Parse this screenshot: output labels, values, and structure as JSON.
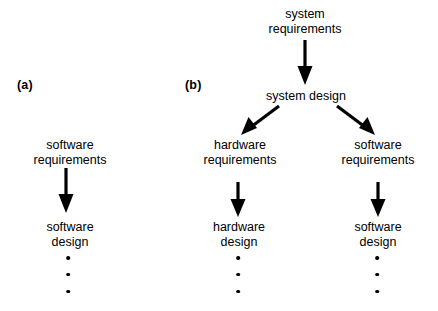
{
  "figure": {
    "background_color": "#ffffff",
    "ink_color": "#000000",
    "panels": [
      {
        "id": "a",
        "label": "(a)",
        "nodes": [
          {
            "id": "sw-req-a",
            "lines": [
              "software",
              "requirements"
            ]
          },
          {
            "id": "sw-design-a",
            "lines": [
              "software",
              "design"
            ]
          }
        ],
        "ellipsis_dots": 3
      },
      {
        "id": "b",
        "label": "(b)",
        "nodes": [
          {
            "id": "sys-req-b",
            "lines": [
              "system",
              "requirements"
            ]
          },
          {
            "id": "sys-design-b",
            "lines": [
              "system design"
            ]
          },
          {
            "id": "hw-req-b",
            "lines": [
              "hardware",
              "requirements"
            ]
          },
          {
            "id": "sw-req-b",
            "lines": [
              "software",
              "requirements"
            ]
          },
          {
            "id": "hw-design-b",
            "lines": [
              "hardware",
              "design"
            ]
          },
          {
            "id": "sw-design-b",
            "lines": [
              "software",
              "design"
            ]
          }
        ],
        "ellipsis_dots_left": 3,
        "ellipsis_dots_right": 3
      }
    ]
  },
  "panel_a": {
    "label": "(a)",
    "software_requirements_line1": "software",
    "software_requirements_line2": "requirements",
    "software_design_line1": "software",
    "software_design_line2": "design"
  },
  "panel_b": {
    "label": "(b)",
    "system_requirements_line1": "system",
    "system_requirements_line2": "requirements",
    "system_design_line1": "system design",
    "hardware_requirements_line1": "hardware",
    "hardware_requirements_line2": "requirements",
    "software_requirements_line1": "software",
    "software_requirements_line2": "requirements",
    "hardware_design_line1": "hardware",
    "hardware_design_line2": "design",
    "software_design_line1": "software",
    "software_design_line2": "design"
  }
}
